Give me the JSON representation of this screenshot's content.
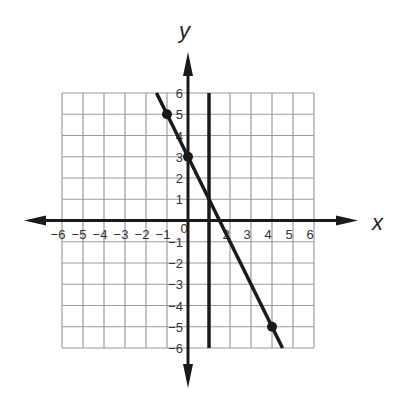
{
  "chart_data": {
    "type": "line",
    "title": "",
    "xlabel": "x",
    "ylabel": "y",
    "xlim": [
      -6,
      6
    ],
    "ylim": [
      -6,
      6
    ],
    "grid": true,
    "x_ticks": [
      -6,
      -5,
      -4,
      -3,
      -2,
      -1,
      0,
      2,
      3,
      4,
      5,
      6
    ],
    "y_ticks": [
      6,
      5,
      4,
      3,
      2,
      1,
      -1,
      -2,
      -3,
      -4,
      -5,
      -6
    ],
    "series": [
      {
        "name": "line y = -2x + 3",
        "type": "line",
        "x": [
          -1.5,
          4.5
        ],
        "y": [
          6,
          -6
        ],
        "marked_points": [
          [
            -1,
            5
          ],
          [
            0,
            3
          ],
          [
            4,
            -5
          ]
        ]
      },
      {
        "name": "vertical line x = 1",
        "type": "line",
        "x": [
          1,
          1
        ],
        "y": [
          6,
          -6
        ],
        "marked_points": []
      }
    ],
    "colors": {
      "grid": "#9a9a9a",
      "axis": "#1a1a1a",
      "line": "#1a1a1a"
    }
  }
}
